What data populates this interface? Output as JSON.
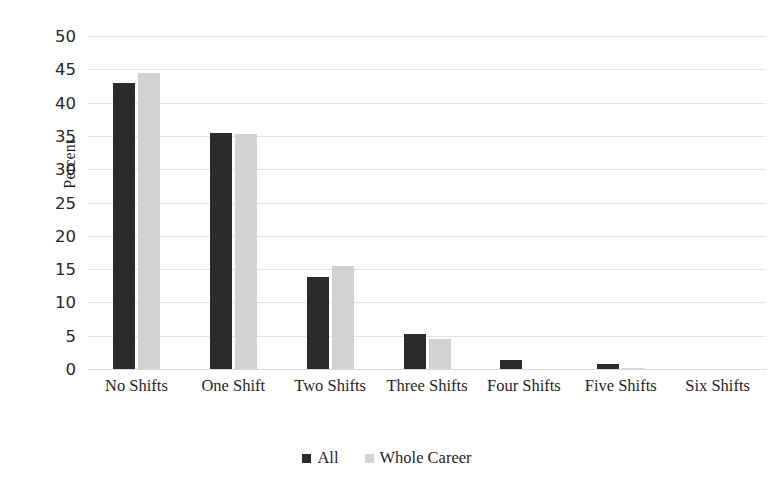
{
  "chart_data": {
    "type": "bar",
    "title": "",
    "xlabel": "",
    "ylabel": "Percent",
    "ylim": [
      0,
      50
    ],
    "ytick_step": 5,
    "yticks": [
      0,
      5,
      10,
      15,
      20,
      25,
      30,
      35,
      40,
      45,
      50
    ],
    "grid": true,
    "legend_position": "bottom",
    "categories": [
      "No Shifts",
      "One Shift",
      "Two Shifts",
      "Three Shifts",
      "Four Shifts",
      "Five Shifts",
      "Six Shifts"
    ],
    "series": [
      {
        "name": "All",
        "color": "#2b2b2b",
        "values": [
          43.0,
          35.4,
          13.8,
          5.2,
          1.3,
          0.8,
          0.0
        ]
      },
      {
        "name": "Whole Career",
        "color": "#d2d2d2",
        "values": [
          44.5,
          35.3,
          15.4,
          4.5,
          0.0,
          0.2,
          0.0
        ]
      }
    ]
  },
  "axes": {
    "y_title": "Percent"
  },
  "legend": {
    "items": [
      {
        "label": "All",
        "color": "#2b2b2b"
      },
      {
        "label": "Whole Career",
        "color": "#d2d2d2"
      }
    ]
  }
}
